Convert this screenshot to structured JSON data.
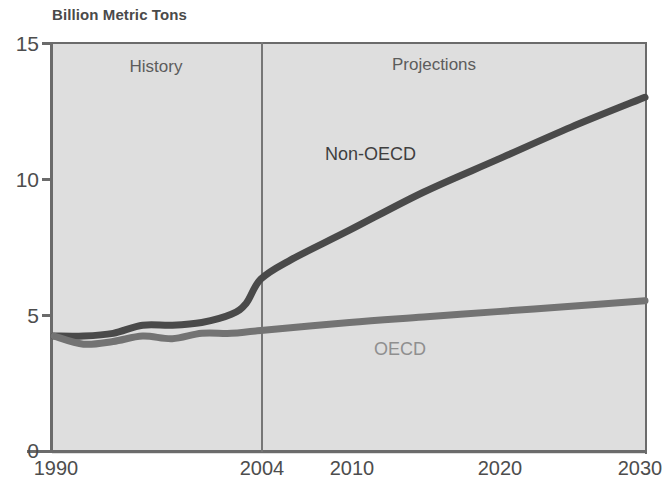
{
  "chart_data": {
    "type": "line",
    "title": "Billion Metric Tons",
    "xlabel": "",
    "ylabel": "Billion Metric Tons",
    "xlim": [
      1990,
      2030
    ],
    "ylim": [
      0,
      15
    ],
    "grid": false,
    "legend_position": "inline-annotations",
    "x_ticks": [
      "1990",
      "2004",
      "2010",
      "2020",
      "2030"
    ],
    "x_tick_values": [
      1990,
      2004,
      2010,
      2020,
      2030
    ],
    "y_ticks": [
      "0",
      "5",
      "10",
      "15"
    ],
    "y_tick_values": [
      0,
      5,
      10,
      15
    ],
    "annotations": [
      {
        "text": "History",
        "x": 1997,
        "y": 14.0
      },
      {
        "text": "Projections",
        "x": 2016,
        "y": 14.1
      }
    ],
    "divider": {
      "label": "2004",
      "x": 2004,
      "note": "history / projections boundary"
    },
    "series": [
      {
        "name": "Non-OECD",
        "color": "#4a4a4a",
        "label_x": 2009,
        "label_y": 11.2,
        "x": [
          1990,
          1992,
          1994,
          1996,
          1998,
          2000,
          2002,
          2003,
          2004,
          2006,
          2010,
          2015,
          2020,
          2025,
          2030
        ],
        "values": [
          4.2,
          4.2,
          4.3,
          4.6,
          4.6,
          4.7,
          5.0,
          5.4,
          6.3,
          7.0,
          8.1,
          9.5,
          10.7,
          11.9,
          13.0
        ]
      },
      {
        "name": "OECD",
        "color": "#737373",
        "label_x": 2016,
        "label_y": 3.9,
        "x": [
          1990,
          1992,
          1994,
          1996,
          1998,
          2000,
          2002,
          2004,
          2010,
          2015,
          2020,
          2025,
          2030
        ],
        "values": [
          4.2,
          3.9,
          4.0,
          4.2,
          4.1,
          4.3,
          4.3,
          4.4,
          4.7,
          4.9,
          5.1,
          5.3,
          5.5
        ]
      }
    ],
    "colors": {
      "plot_background": "#dedede",
      "page_background": "#ffffff",
      "axis": "#6b6b6b",
      "text": "#4d4d4d",
      "divider": "#767676",
      "non_oecd": "#4a4a4a",
      "oecd": "#737373"
    }
  }
}
